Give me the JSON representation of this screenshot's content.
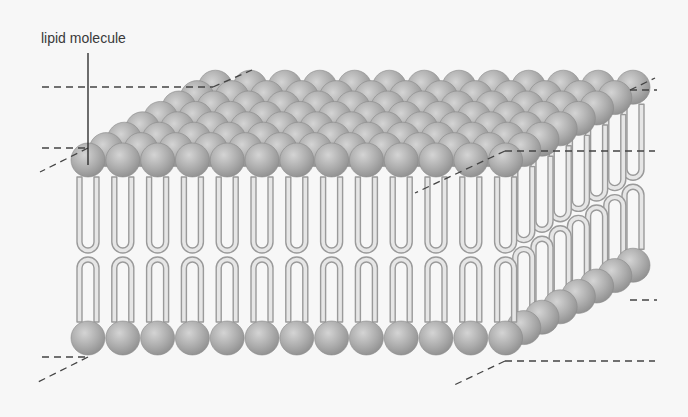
{
  "diagram": {
    "labels": [
      {
        "id": "lipid-molecule",
        "text": "lipid molecule",
        "x": 41,
        "y": 30
      }
    ],
    "colors": {
      "background": "#f7f7f7",
      "head_light": "#d2d2d2",
      "head_mid": "#aaaaaa",
      "head_dark": "#8c8c8c",
      "tail_fill": "#e6e6e6",
      "tail_stroke": "#9a9a9a",
      "dash": "#444444",
      "leader": "#222222"
    },
    "geometry": {
      "front_count": 13,
      "front_x0": 88,
      "spacing": 34.8,
      "head_r": 17,
      "top_head_y": 160,
      "bottom_head_y": 338,
      "depth_rows": 7,
      "depth_dx": 18.2,
      "depth_dy": -10.4,
      "top_tail_top": 177,
      "top_tail_bottom": 253,
      "bottom_tail_top": 257,
      "bottom_tail_bottom": 322
    },
    "dashed_lines": [
      {
        "name": "top-back-horizontal",
        "x1": 42,
        "y1": 87,
        "x2": 213,
        "y2": 87
      },
      {
        "name": "top-back-diagonal",
        "x1": 213,
        "y1": 87,
        "x2": 252,
        "y2": 70
      },
      {
        "name": "top-front-horizontal",
        "x1": 42,
        "y1": 148,
        "x2": 88,
        "y2": 148
      },
      {
        "name": "top-front-diagonal",
        "x1": 88,
        "y1": 148,
        "x2": 40,
        "y2": 172
      },
      {
        "name": "top-right-horizontal",
        "x1": 505,
        "y1": 151,
        "x2": 655,
        "y2": 151
      },
      {
        "name": "top-right-diagonal",
        "x1": 505,
        "y1": 151,
        "x2": 415,
        "y2": 193
      },
      {
        "name": "top-corner-horizontal",
        "x1": 630,
        "y1": 90,
        "x2": 657,
        "y2": 90
      },
      {
        "name": "top-corner-diagonal",
        "x1": 630,
        "y1": 90,
        "x2": 655,
        "y2": 78
      },
      {
        "name": "bottom-left-horizontal",
        "x1": 42,
        "y1": 357,
        "x2": 88,
        "y2": 357
      },
      {
        "name": "bottom-left-diagonal",
        "x1": 88,
        "y1": 357,
        "x2": 38,
        "y2": 382
      },
      {
        "name": "bottom-front-horizontal",
        "x1": 505,
        "y1": 361,
        "x2": 655,
        "y2": 361
      },
      {
        "name": "bottom-front-diagonal",
        "x1": 505,
        "y1": 361,
        "x2": 452,
        "y2": 386
      },
      {
        "name": "bottom-right-horizontal",
        "x1": 630,
        "y1": 300,
        "x2": 657,
        "y2": 300
      }
    ],
    "leader_line": {
      "x1": 88,
      "y1": 53,
      "x2": 88,
      "y2": 165
    }
  }
}
